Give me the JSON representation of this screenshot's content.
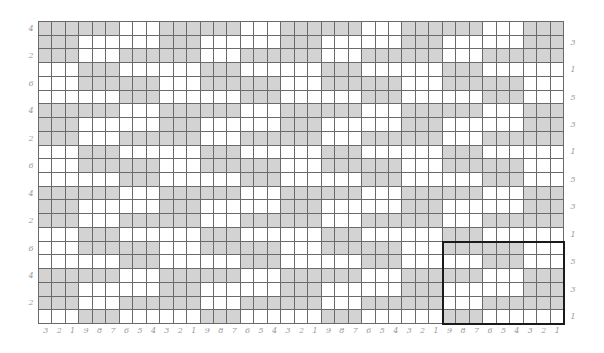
{
  "chart": {
    "type": "knitting-colorwork-chart",
    "columns": 39,
    "rows": 22,
    "colors": {
      "contrast": "#d3d3d3",
      "main": "#ffffff",
      "grid": "#6a6a6a",
      "repeat_box": "#1a1a1a",
      "label": "#9a9a9a"
    },
    "repeat": {
      "width": 9,
      "height": 6,
      "pattern_top_to_bottom": [
        "GGGGGGWWW",
        "WWWGGGWWW",
        "GGGWWWGGG",
        "WWWWWWGGG",
        "WWWGGGGGG",
        "GGGWWWWWW"
      ],
      "box": {
        "col_start": 31,
        "col_end": 39,
        "row_start": 17,
        "row_end": 22
      }
    },
    "column_labels": [
      "3",
      "2",
      "1",
      "9",
      "8",
      "7",
      "6",
      "5",
      "4",
      "3",
      "2",
      "1",
      "9",
      "8",
      "7",
      "6",
      "5",
      "4",
      "3",
      "2",
      "1",
      "9",
      "8",
      "7",
      "6",
      "5",
      "4",
      "3",
      "2",
      "1",
      "9",
      "8",
      "7",
      "6",
      "5",
      "4",
      "3",
      "2",
      "1"
    ],
    "left_row_labels": [
      {
        "row": 1,
        "label": "4"
      },
      {
        "row": 3,
        "label": "2"
      },
      {
        "row": 5,
        "label": "6"
      },
      {
        "row": 7,
        "label": "4"
      },
      {
        "row": 9,
        "label": "2"
      },
      {
        "row": 11,
        "label": "6"
      },
      {
        "row": 13,
        "label": "4"
      },
      {
        "row": 15,
        "label": "2"
      },
      {
        "row": 17,
        "label": "6"
      },
      {
        "row": 19,
        "label": "4"
      },
      {
        "row": 21,
        "label": "2"
      }
    ],
    "right_row_labels": [
      {
        "row": 2,
        "label": "3"
      },
      {
        "row": 4,
        "label": "1"
      },
      {
        "row": 6,
        "label": "5"
      },
      {
        "row": 8,
        "label": "3"
      },
      {
        "row": 10,
        "label": "1"
      },
      {
        "row": 12,
        "label": "5"
      },
      {
        "row": 14,
        "label": "3"
      },
      {
        "row": 16,
        "label": "1"
      },
      {
        "row": 18,
        "label": "5"
      },
      {
        "row": 20,
        "label": "3"
      },
      {
        "row": 22,
        "label": "1"
      }
    ]
  }
}
